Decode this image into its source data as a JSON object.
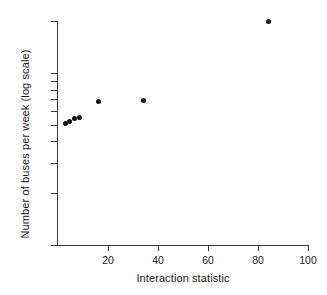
{
  "chart_data": {
    "type": "scatter",
    "title": "",
    "xlabel": "Interaction statistic",
    "ylabel": "Number of buses per week (log scale)",
    "xlim": [
      0,
      100
    ],
    "ylim": [
      10,
      200
    ],
    "yscale": "log",
    "xscale": "linear",
    "grid": false,
    "legend": null,
    "xticks": [
      20,
      40,
      60,
      80,
      100
    ],
    "xtick_labels": [
      "20",
      "40",
      "60",
      "80",
      "100"
    ],
    "yticks": [
      10,
      20,
      30,
      40,
      50,
      60,
      70,
      80,
      90,
      100,
      200
    ],
    "ytick_labels": [
      "10",
      "20",
      "30",
      "40",
      "50",
      "60",
      "70",
      "80",
      "90",
      "100",
      "200"
    ],
    "marker": "filled-circle",
    "marker_color": "#111111",
    "points": [
      {
        "x": 2.8,
        "y": 51
      },
      {
        "x": 4.6,
        "y": 52
      },
      {
        "x": 6.4,
        "y": 54
      },
      {
        "x": 8.4,
        "y": 55
      },
      {
        "x": 16.0,
        "y": 68
      },
      {
        "x": 34.0,
        "y": 69
      },
      {
        "x": 84.0,
        "y": 198
      }
    ]
  },
  "axes": {
    "x_title": "Interaction statistic",
    "y_title": "Number of buses per week (log scale)"
  },
  "artifact": {
    "top_cropped_text": ""
  }
}
